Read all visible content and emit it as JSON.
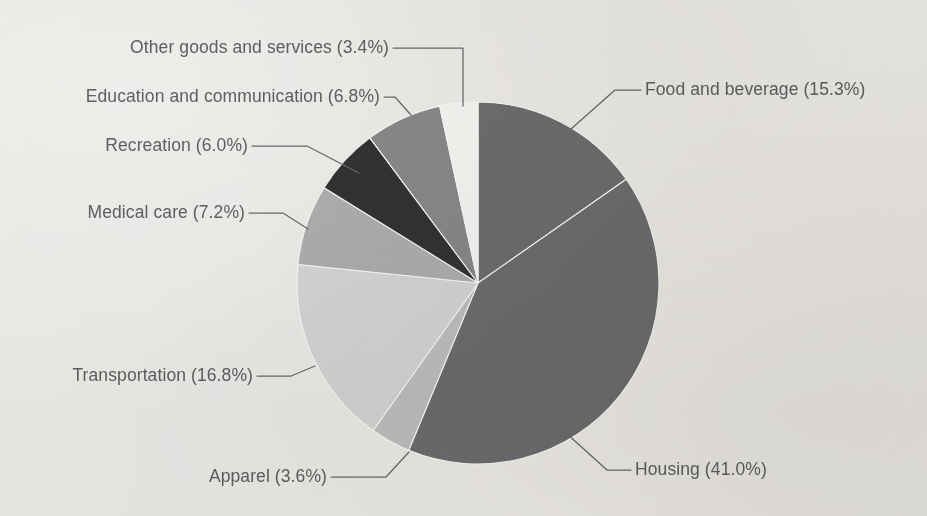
{
  "figure": {
    "background_color": "#f2f1ef",
    "label_text_color": "#5f6163",
    "leader_line_color": "#6a6c6e"
  },
  "chart_data": {
    "type": "pie",
    "title": "",
    "subtitle": "",
    "xlabel": "",
    "ylabel": "",
    "legend_position": "none",
    "labels_format": "{category} ({value}%)",
    "start_angle_deg": 0,
    "direction": "clockwise",
    "categories": [
      "Food and beverage",
      "Housing",
      "Apparel",
      "Transportation",
      "Medical care",
      "Recreation",
      "Education and communication",
      "Other goods and services"
    ],
    "values": [
      15.3,
      41.0,
      3.6,
      16.8,
      7.2,
      6.0,
      6.8,
      3.4
    ],
    "colors": [
      "#6e7072",
      "#6e7072",
      "#c3c4c5",
      "#d9dadb",
      "#b0b2b3",
      "#333436",
      "#8a8c8e",
      "#fbfbfa"
    ],
    "slice_labels": [
      "Food and beverage (15.3%)",
      "Housing (41.0%)",
      "Apparel (3.6%)",
      "Transportation (16.8%)",
      "Medical care (7.2%)",
      "Recreation (6.0%)",
      "Education and communication (6.8%)",
      "Other goods and services (3.4%)"
    ],
    "annotations": [
      "Slices drawn clockwise from 12 o'clock.",
      "Percentages as printed sum to 100.1%."
    ]
  },
  "labels": {
    "food_and_beverage": "Food and beverage (15.3%)",
    "housing": "Housing (41.0%)",
    "apparel": "Apparel (3.6%)",
    "transportation": "Transportation (16.8%)",
    "medical_care": "Medical care (7.2%)",
    "recreation": "Recreation (6.0%)",
    "education_and_communication": "Education and communication (6.8%)",
    "other_goods_and_services": "Other goods and services (3.4%)"
  }
}
